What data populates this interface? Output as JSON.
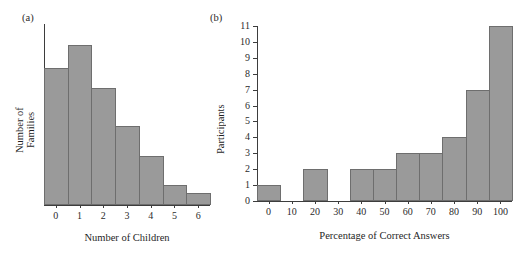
{
  "figure": {
    "panel_a_tag": "(a)",
    "panel_b_tag": "(b)",
    "bar_color": "#9a9a9a",
    "bar_edge_color": "#6e6e6e",
    "axis_color": "#3d3d3d"
  },
  "chart_data": [
    {
      "type": "bar",
      "panel": "(a)",
      "title": "",
      "xlabel": "Number of Children",
      "ylabel": "Number of Families",
      "categories": [
        "0",
        "1",
        "2",
        "3",
        "4",
        "5",
        "6"
      ],
      "values": [
        8.3,
        9.7,
        7.1,
        4.8,
        3.0,
        1.2,
        0.7
      ],
      "xlim": [
        -0.5,
        6.5
      ],
      "ylim": [
        0,
        11
      ],
      "ytick_labels": [],
      "grid": false,
      "legend": false
    },
    {
      "type": "bar",
      "panel": "(b)",
      "title": "",
      "xlabel": "Percentage of Correct Answers",
      "ylabel": "Participants",
      "categories": [
        "0",
        "10",
        "20",
        "30",
        "40",
        "50",
        "60",
        "70",
        "80",
        "90",
        "100"
      ],
      "values": [
        1,
        0,
        2,
        0,
        2,
        2,
        3,
        3,
        4,
        7,
        11
      ],
      "xlim": [
        -5,
        105
      ],
      "ylim": [
        0,
        11
      ],
      "ytick_labels": [
        "0",
        "1",
        "2",
        "3",
        "4",
        "5",
        "6",
        "7",
        "8",
        "9",
        "10",
        "11"
      ],
      "xtick_labels": [
        "0",
        "10",
        "20",
        "30",
        "40",
        "50",
        "60",
        "70",
        "80",
        "90",
        "100"
      ],
      "grid": false,
      "legend": false
    }
  ]
}
